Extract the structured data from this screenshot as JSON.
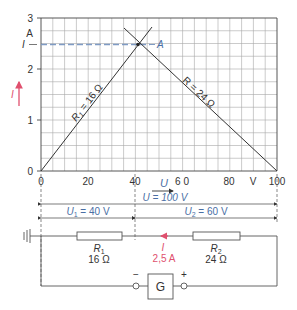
{
  "chart_data": {
    "type": "line",
    "title": "",
    "xlabel": "U",
    "xunit": "V",
    "ylabel": "I",
    "yunit": "A",
    "xlim": [
      0,
      100
    ],
    "ylim": [
      0,
      3
    ],
    "x_ticks": [
      "0",
      "20",
      "40",
      "6 0",
      "80",
      "100"
    ],
    "y_ticks": [
      "0",
      "1",
      "2",
      "3"
    ],
    "grid": true,
    "series": [
      {
        "name": "R1 = 16 Ω",
        "x": [
          0,
          45
        ],
        "y": [
          0,
          2.8125
        ]
      },
      {
        "name": "R = 24 Ω",
        "x": [
          32.5,
          100
        ],
        "y": [
          2.8125,
          0
        ]
      }
    ],
    "annotations": [
      {
        "text": "A",
        "x": 40,
        "y": 2.5,
        "note": "operating point"
      },
      {
        "text": "I",
        "y": 2.5,
        "note": "dashed current line"
      }
    ]
  },
  "graph": {
    "y_unit": "A",
    "y_marker": "I",
    "y_axis_arrow_label": "I",
    "x_unit": "V",
    "x_arrow_label": "U",
    "point_label": "A",
    "line1_label_prefix": "R",
    "line1_label_sub": "1",
    "line1_label_suffix": " = 16 Ω",
    "line2_label": "R = 24 Ω",
    "ticks_x": [
      "0",
      "20",
      "40",
      "6 0",
      "80",
      "100"
    ],
    "ticks_y": [
      "0",
      "1",
      "2",
      "3"
    ]
  },
  "dimensions": {
    "total": "U = 100 V",
    "u1_prefix": "U",
    "u1_sub": "1",
    "u1_suffix": " = 40 V",
    "u2_prefix": "U",
    "u2_sub": "2",
    "u2_suffix": " = 60 V"
  },
  "circuit": {
    "r1_name": "R",
    "r1_sub": "1",
    "r1_value": "16 Ω",
    "r2_name": "R",
    "r2_sub": "2",
    "r2_value": "24 Ω",
    "current_label": "I",
    "current_value": "2,5 A",
    "generator_label": "G",
    "minus": "−",
    "plus": "+"
  },
  "colors": {
    "grid": "#9a9a9a",
    "line": "#333333",
    "dimension_blue": "#4a6fa5",
    "current_red": "#e0506e"
  }
}
